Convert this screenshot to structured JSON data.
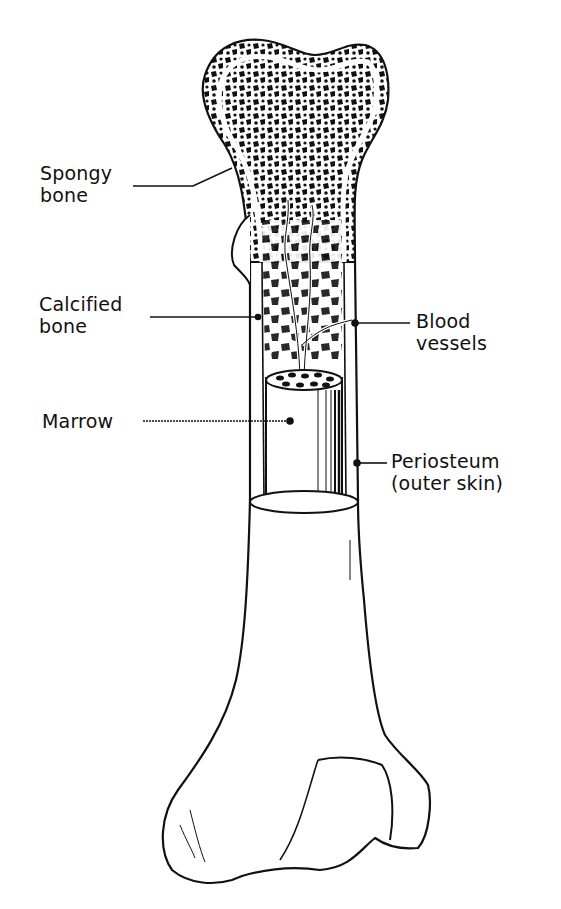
{
  "diagram": {
    "colors": {
      "ink": "#111111",
      "paper": "#ffffff"
    },
    "labels": {
      "spongy_bone": {
        "line1": "Spongy",
        "line2": "bone"
      },
      "calcified_bone": {
        "line1": "Calcified",
        "line2": "bone"
      },
      "marrow": {
        "line1": "Marrow"
      },
      "blood_vessels": {
        "line1": "Blood",
        "line2": "vessels"
      },
      "periosteum": {
        "line1": "Periosteum",
        "line2": "(outer skin)"
      }
    }
  }
}
